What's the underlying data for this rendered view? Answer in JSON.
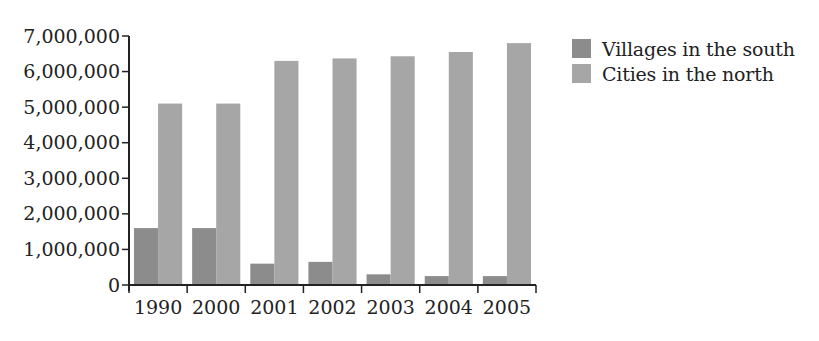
{
  "chart_data": {
    "type": "bar",
    "title": "",
    "xlabel": "",
    "ylabel": "",
    "categories": [
      "1990",
      "2000",
      "2001",
      "2002",
      "2003",
      "2004",
      "2005"
    ],
    "series": [
      {
        "name": "Villages in the south",
        "color": "#8c8c8c",
        "values": [
          1600000,
          1600000,
          600000,
          650000,
          300000,
          250000,
          250000
        ]
      },
      {
        "name": "Cities in the north",
        "color": "#a6a6a6",
        "values": [
          5100000,
          5100000,
          6300000,
          6370000,
          6430000,
          6550000,
          6800000
        ]
      }
    ],
    "ylim": [
      0,
      7000000
    ],
    "yticks": [
      0,
      1000000,
      2000000,
      3000000,
      4000000,
      5000000,
      6000000,
      7000000
    ],
    "ytick_labels": [
      "0",
      "1,000,000",
      "2,000,000",
      "3,000,000",
      "4,000,000",
      "5,000,000",
      "6,000,000",
      "7,000,000"
    ],
    "grid": false,
    "legend_position": "right-top"
  },
  "legend": {
    "items": [
      {
        "label": "Villages in the south",
        "color": "#8c8c8c"
      },
      {
        "label": "Cities in the north",
        "color": "#a6a6a6"
      }
    ]
  }
}
